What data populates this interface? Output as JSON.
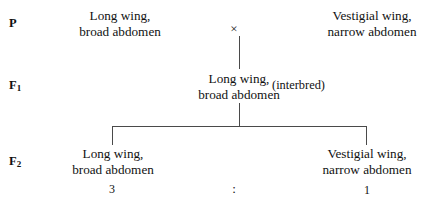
{
  "diagram": {
    "background_color": "#ffffff",
    "line_color": "#4a4a4a",
    "text_color": "#111111"
  },
  "generations": {
    "parental": {
      "label": "P",
      "label_main": "P",
      "label_sub": "",
      "left_parent": {
        "line1": "Long wing,",
        "line2": "broad abdomen"
      },
      "cross_symbol": "×",
      "right_parent": {
        "line1": "Vestigial wing,",
        "line2": "narrow abdomen"
      }
    },
    "f1": {
      "label_main": "F",
      "label_sub": "1",
      "offspring": {
        "line1": "Long wing,",
        "line2": "broad abdomen"
      },
      "note": "(interbred)"
    },
    "f2": {
      "label_main": "F",
      "label_sub": "2",
      "left_offspring": {
        "line1": "Long wing,",
        "line2": "broad abdomen"
      },
      "right_offspring": {
        "line1": "Vestigial wing,",
        "line2": "narrow abdomen"
      },
      "ratio": {
        "left_value": "3",
        "separator": ":",
        "right_value": "1"
      }
    }
  }
}
